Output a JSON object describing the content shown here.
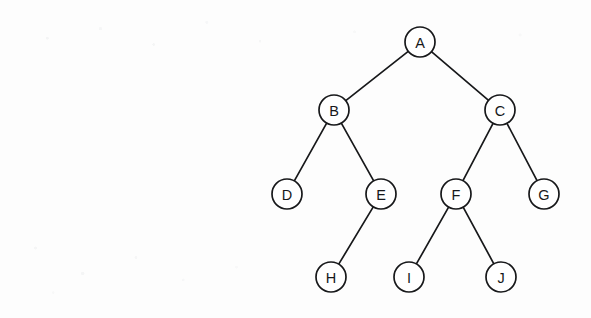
{
  "diagram": {
    "kind": "binary-tree",
    "canvas": {
      "width": 591,
      "height": 318
    },
    "style": {
      "background_color": "#fdfdfd",
      "stroke_color": "#17181a",
      "node_fill_color": "#ffffff",
      "node_radius": 15,
      "stroke_width": 1.7,
      "label_font_size": 14.5
    },
    "nodes": [
      {
        "id": "A",
        "label": "A",
        "x": 420,
        "y": 42,
        "level": 0
      },
      {
        "id": "B",
        "label": "B",
        "x": 334,
        "y": 110,
        "level": 1
      },
      {
        "id": "C",
        "label": "C",
        "x": 500,
        "y": 110,
        "level": 1
      },
      {
        "id": "D",
        "label": "D",
        "x": 287,
        "y": 194,
        "level": 2
      },
      {
        "id": "E",
        "label": "E",
        "x": 381,
        "y": 194,
        "level": 2
      },
      {
        "id": "F",
        "label": "F",
        "x": 456,
        "y": 194,
        "level": 2
      },
      {
        "id": "G",
        "label": "G",
        "x": 544,
        "y": 194,
        "level": 2
      },
      {
        "id": "H",
        "label": "H",
        "x": 331,
        "y": 277,
        "level": 3
      },
      {
        "id": "I",
        "label": "I",
        "x": 409,
        "y": 277,
        "level": 3
      },
      {
        "id": "J",
        "label": "J",
        "x": 501,
        "y": 277,
        "level": 3
      }
    ],
    "edges": [
      {
        "from": "A",
        "to": "B",
        "side": "left"
      },
      {
        "from": "A",
        "to": "C",
        "side": "right"
      },
      {
        "from": "B",
        "to": "D",
        "side": "left"
      },
      {
        "from": "B",
        "to": "E",
        "side": "right"
      },
      {
        "from": "C",
        "to": "F",
        "side": "left"
      },
      {
        "from": "C",
        "to": "G",
        "side": "right"
      },
      {
        "from": "E",
        "to": "H",
        "side": "left"
      },
      {
        "from": "F",
        "to": "I",
        "side": "left"
      },
      {
        "from": "F",
        "to": "J",
        "side": "right"
      }
    ]
  }
}
